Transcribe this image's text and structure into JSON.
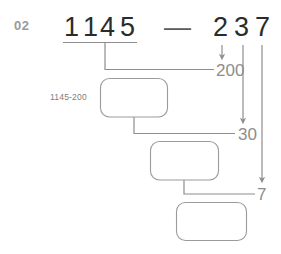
{
  "page": {
    "step_number": "02",
    "width": 281,
    "height": 254,
    "background_color": "#ffffff",
    "digit_color": "#2b2b2b",
    "label_color": "#8d8d8d",
    "line_color": "#8e8e8e",
    "box_border_color": "#9b9b9b"
  },
  "equation": {
    "minuend_digits": [
      "1",
      "1",
      "4",
      "5"
    ],
    "operator": "—",
    "subtrahend_digits": [
      "2",
      "3",
      "7"
    ]
  },
  "carries": [
    {
      "value": "200"
    },
    {
      "value": "30"
    },
    {
      "value": "7"
    }
  ],
  "hints": [
    {
      "text": "1145-200"
    }
  ],
  "answer_boxes": [
    {
      "value": ""
    },
    {
      "value": ""
    },
    {
      "value": ""
    }
  ]
}
